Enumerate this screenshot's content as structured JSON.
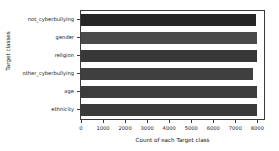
{
  "chart_data": {
    "type": "bar",
    "orientation": "horizontal",
    "title": "",
    "xlabel": "Count of each Target class",
    "ylabel": "Target classes",
    "categories": [
      "not_cyberbullying",
      "gender",
      "religion",
      "other_cyberbullying",
      "age",
      "ethnicity"
    ],
    "values": [
      7940,
      7973,
      7998,
      7823,
      7992,
      7961
    ],
    "xlim": [
      0,
      8300
    ],
    "xticks": [
      0,
      1000,
      2000,
      3000,
      4000,
      5000,
      6000,
      7000,
      8000
    ],
    "xticklabels": [
      "0",
      "1000",
      "2000",
      "3000",
      "4000",
      "5000",
      "6000",
      "7000",
      "8000"
    ],
    "grid": false,
    "legend": null,
    "bar_colors": [
      "#262626",
      "#4a4a4a",
      "#383838",
      "#3f3f3f",
      "#3c3c3c",
      "#3a3a3a"
    ],
    "axis_color": "#3b3b3b",
    "background": "#ffffff"
  }
}
